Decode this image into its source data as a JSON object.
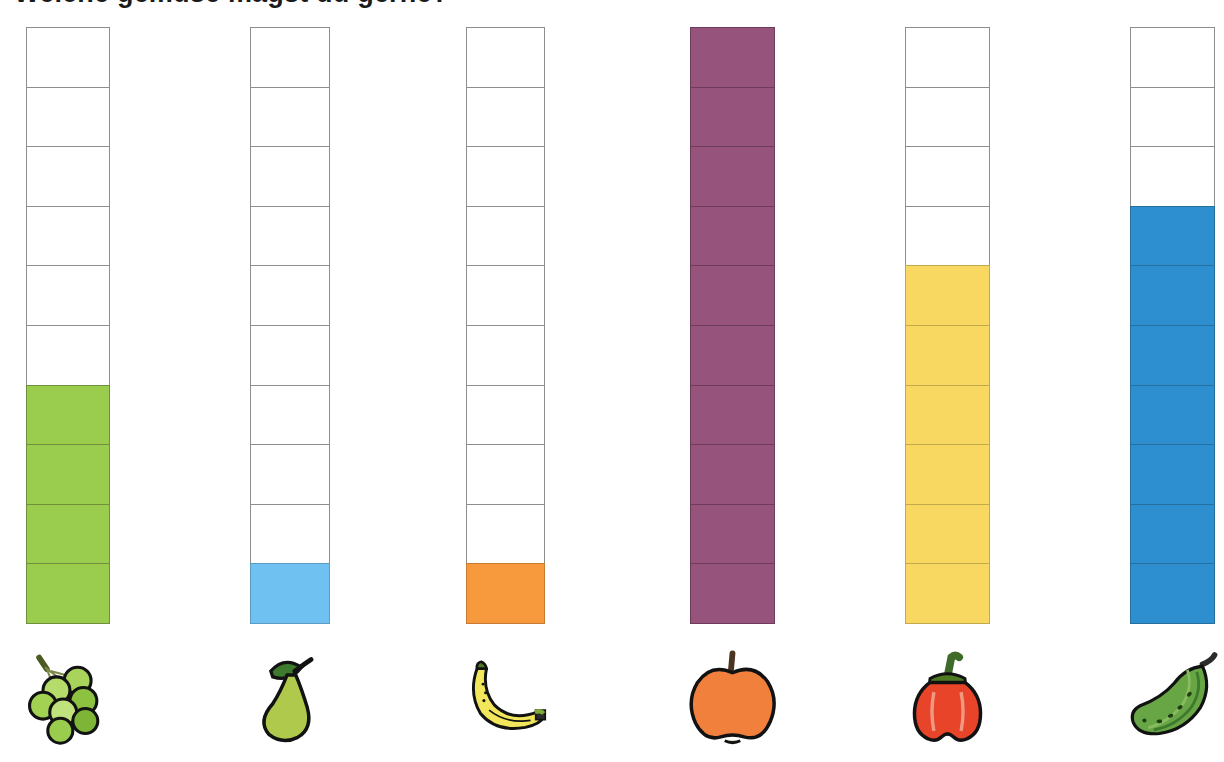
{
  "title": {
    "text": "Welche gemuse magst du gerne?",
    "note": "heading clipped at top edge; only letter descenders visible"
  },
  "chart_data": {
    "type": "bar",
    "title": "",
    "xlabel": "",
    "ylabel": "",
    "grid": true,
    "legend": "none",
    "ylim": [
      0,
      10
    ],
    "scale_max_cells": 10,
    "categories": [
      "grapes",
      "pear",
      "banana",
      "apple",
      "bell-pepper",
      "cucumber"
    ],
    "values": [
      4,
      1,
      1,
      10,
      6,
      7
    ],
    "series": [
      {
        "name": "votes",
        "values": [
          4,
          1,
          1,
          10,
          6,
          7
        ]
      }
    ],
    "bars": [
      {
        "id": "grapes",
        "label": "grapes",
        "value": 4,
        "total_cells": 10,
        "fill": "#9ACD4E",
        "border": "#6f8f3e",
        "x": 26,
        "width": 84
      },
      {
        "id": "pear",
        "label": "pear",
        "value": 1,
        "total_cells": 10,
        "fill": "#6EC1F0",
        "border": "#5a9cc4",
        "x": 250,
        "width": 80
      },
      {
        "id": "banana",
        "label": "banana",
        "value": 1,
        "total_cells": 10,
        "fill": "#F79A3E",
        "border": "#c77b33",
        "x": 466,
        "width": 79
      },
      {
        "id": "apple",
        "label": "apple",
        "value": 10,
        "total_cells": 10,
        "fill": "#96537C",
        "border": "#6d3c5a",
        "x": 690,
        "width": 85
      },
      {
        "id": "bell-pepper",
        "label": "bell pepper",
        "value": 6,
        "total_cells": 10,
        "fill": "#F8D860",
        "border": "#c2a94b",
        "x": 905,
        "width": 85
      },
      {
        "id": "cucumber",
        "label": "cucumber",
        "value": 7,
        "total_cells": 10,
        "fill": "#2E8FD0",
        "border": "#26709f",
        "x": 1130,
        "width": 85
      }
    ]
  },
  "icons": [
    {
      "name": "grapes-icon",
      "for": "grapes"
    },
    {
      "name": "pear-icon",
      "for": "pear"
    },
    {
      "name": "banana-icon",
      "for": "banana"
    },
    {
      "name": "apple-icon",
      "for": "apple"
    },
    {
      "name": "bell-pepper-icon",
      "for": "bell-pepper"
    },
    {
      "name": "cucumber-icon",
      "for": "cucumber"
    }
  ],
  "colors": {
    "grapes": "#9ACD4E",
    "pear": "#6EC1F0",
    "banana": "#F79A3E",
    "apple": "#96537C",
    "bell_pepper": "#F8D860",
    "cucumber": "#2E8FD0",
    "empty_cell": "#ffffff",
    "cell_outline": "#8d8d8d",
    "background": "#ffffff"
  },
  "layout": {
    "bar_top": 27,
    "bar_bottom": 633,
    "cell_height": 60.6
  }
}
